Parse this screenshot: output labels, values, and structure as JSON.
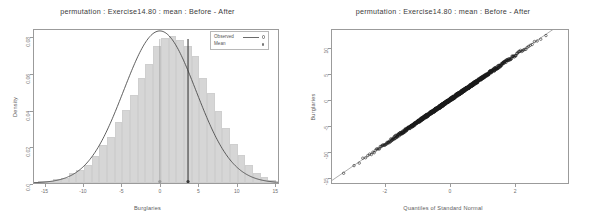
{
  "figure": {
    "width": 591,
    "height": 224,
    "background": "#ffffff",
    "panel_count": 2
  },
  "chart_data": [
    {
      "type": "bar",
      "name": "permutation-density-histogram",
      "title": "permutation : Exercise14.80 : mean : Before - After",
      "xlabel": "Burglaries",
      "ylabel": "Density",
      "xlim": [
        -16.5,
        15.5
      ],
      "ylim": [
        0,
        0.0845
      ],
      "grid": false,
      "xticks": [
        -15,
        -10,
        -5,
        0,
        5,
        10,
        15
      ],
      "xticklabels": [
        "-15",
        "-10",
        "-5",
        "0",
        "5",
        "10",
        "15"
      ],
      "yticks": [
        0.0,
        0.02,
        0.04,
        0.06,
        0.08
      ],
      "yticklabels": [
        "0.0",
        "0.02",
        "0.04",
        "0.06",
        "0.08"
      ],
      "bar_color": "#d6d6d6",
      "bar_edge_color": "#cfcfcf",
      "bin_width": 1,
      "bin_left_edges": [
        -16,
        -15,
        -14,
        -13,
        -12,
        -11,
        -10,
        -9,
        -8,
        -7,
        -6,
        -5,
        -4,
        -3,
        -2,
        -1,
        0,
        1,
        2,
        3,
        4,
        5,
        6,
        7,
        8,
        9,
        10,
        11,
        12,
        13,
        14
      ],
      "bin_heights": [
        0.0008,
        0.0012,
        0.0022,
        0.003,
        0.0055,
        0.0072,
        0.0098,
        0.0145,
        0.0205,
        0.0252,
        0.033,
        0.04,
        0.048,
        0.057,
        0.065,
        0.0745,
        0.079,
        0.08,
        0.078,
        0.0745,
        0.069,
        0.0575,
        0.049,
        0.0395,
        0.03,
        0.0215,
        0.0152,
        0.0098,
        0.0055,
        0.0032,
        0.0014
      ],
      "series": [
        {
          "name": "Observed",
          "type": "line",
          "color": "#4a4a4a",
          "description": "normal density overlay curve",
          "mean": 0.0,
          "sd": 4.75,
          "peak": 0.0795
        },
        {
          "name": "Mean",
          "type": "vline",
          "color": "#9a9a9a",
          "x": 0.0
        },
        {
          "name": "Observed statistic",
          "type": "vline",
          "color": "#3a3a3a",
          "x": 3.7
        }
      ],
      "legend": {
        "position": "top-right",
        "entries": [
          {
            "label": "Observed",
            "marker": "line-circle"
          },
          {
            "label": "Mean",
            "marker": "dot"
          }
        ]
      }
    },
    {
      "type": "scatter",
      "name": "normal-qq-plot",
      "title": "permutation : Exercise14.80 : mean : Before - After",
      "xlabel": "Quantiles of Standard Normal",
      "ylabel": "Burglaries",
      "xlim": [
        -3.65,
        3.65
      ],
      "ylim": [
        -16.2,
        13.6
      ],
      "grid": false,
      "xticks": [
        -2,
        0,
        2
      ],
      "xticklabels": [
        "-2",
        "0",
        "2"
      ],
      "yticks": [
        -15,
        -10,
        -5,
        0,
        5,
        10
      ],
      "yticklabels": [
        "-15",
        "-10",
        "-5",
        "0",
        "5",
        "10"
      ],
      "point_marker": "open-circle",
      "point_color": "#1a1a1a",
      "reference_line": {
        "intercept": 0.0,
        "slope": 4.3,
        "color": "#8a8a8a"
      },
      "n_points": 1000
    }
  ]
}
